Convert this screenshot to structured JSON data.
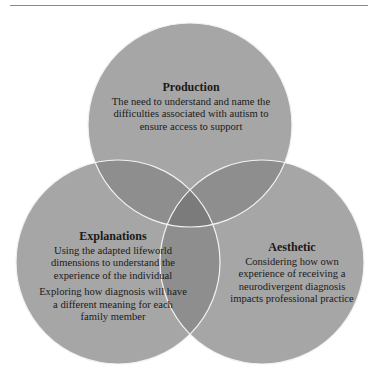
{
  "diagram": {
    "type": "venn-3",
    "colors": {
      "circle_fill": "#a6a6a6",
      "pair_overlap": "#8e8e8e",
      "triple_overlap": "#7b7b7b",
      "stroke": "#f2f2f2",
      "background": "#ffffff",
      "rule": "#8a8a8a"
    },
    "circles": [
      {
        "id": "production",
        "title": "Production",
        "paragraphs": [
          "The need to understand and name the difficulties associated with autism to ensure access to support"
        ]
      },
      {
        "id": "explanations",
        "title": "Explanations",
        "paragraphs": [
          "Using the adapted lifeworld dimensions to understand the experience of the individual",
          "Exploring how diagnosis will have a different meaning for each family member"
        ]
      },
      {
        "id": "aesthetic",
        "title": "Aesthetic",
        "paragraphs": [
          "Considering how own experience of receiving a neurodivergent diagnosis impacts professional practice"
        ]
      }
    ]
  }
}
